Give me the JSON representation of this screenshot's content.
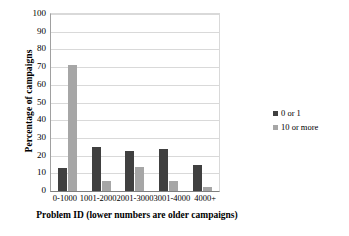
{
  "chart_data": {
    "type": "bar",
    "title": "",
    "subtitle": "",
    "xlabel": "Problem ID (lower numbers are older campaigns)",
    "ylabel": "Percentage of campaigns",
    "categories": [
      "0-1000",
      "1001-2000",
      "2001-3000",
      "3001-4000",
      "4000+"
    ],
    "series": [
      {
        "name": "0 or 1",
        "color": "#404040",
        "values": [
          13,
          25,
          22.5,
          23.5,
          14.5
        ]
      },
      {
        "name": "10 or more",
        "color": "#a6a6a6",
        "values": [
          71,
          5.5,
          13.5,
          5.5,
          2.5
        ]
      }
    ],
    "ylim": [
      0,
      100
    ],
    "ytick_step": 10,
    "yticks": [
      100,
      90,
      80,
      70,
      60,
      50,
      40,
      30,
      20,
      10,
      0
    ],
    "ytick_labels": [
      "100",
      "90",
      "80",
      "70",
      "60",
      "50",
      "40",
      "30",
      "20",
      "10",
      "0"
    ],
    "grid": "horizontal",
    "legend_position": "right",
    "legend_marker": "square"
  }
}
